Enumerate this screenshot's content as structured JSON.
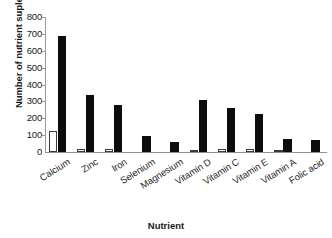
{
  "chart_data": {
    "type": "bar",
    "title": "",
    "xlabel": "Nutrient",
    "ylabel": "Number of nutrient suplement",
    "ylim": [
      0,
      800
    ],
    "yticks": [
      0,
      100,
      200,
      300,
      400,
      500,
      600,
      700,
      800
    ],
    "ytick_labels": [
      "0",
      "100",
      "200",
      "300",
      "400",
      "500",
      "600",
      "700",
      "800"
    ],
    "grid": false,
    "legend": "none",
    "categories": [
      "Calcium",
      "Zinc",
      "Iron",
      "Selenium",
      "Magnesium",
      "Vitamin D",
      "Vitamin C",
      "Vitamin E",
      "Vitamin A",
      "Folic acid"
    ],
    "series": [
      {
        "name": "open-bar-series",
        "style": "white-outlined",
        "color": "#ffffff",
        "edge_color": "#3a3a3a",
        "values": [
          125,
          20,
          20,
          0,
          0,
          10,
          15,
          18,
          5,
          0
        ]
      },
      {
        "name": "filled-bar-series",
        "style": "solid-black",
        "color": "#0d0d0d",
        "edge_color": "#0d0d0d",
        "values": [
          685,
          340,
          280,
          95,
          60,
          310,
          258,
          225,
          80,
          72
        ]
      }
    ]
  }
}
